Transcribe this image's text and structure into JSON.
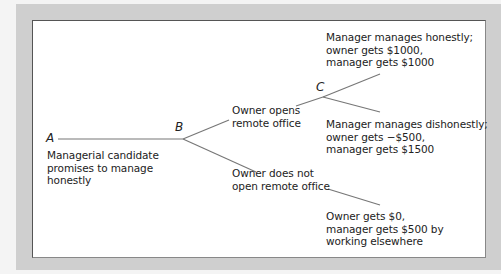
{
  "diagram": {
    "type": "game-tree",
    "nodes": {
      "A": {
        "label": "A"
      },
      "B": {
        "label": "B"
      },
      "C": {
        "label": "C"
      }
    },
    "labels": {
      "a_action": [
        "Managerial candidate",
        "promises to manage",
        "honestly"
      ],
      "b_open": [
        "Owner opens",
        "remote office"
      ],
      "b_not_open": [
        "Owner does not",
        "open remote office"
      ],
      "c_honest": [
        "Manager manages honestly;",
        "owner gets $1000,",
        "manager gets $1000"
      ],
      "c_dishonest": [
        "Manager manages dishonestly;",
        "owner gets −$500,",
        "manager gets $1500"
      ],
      "not_open_payoff": [
        "Owner gets $0,",
        "manager gets $500 by",
        "working elsewhere"
      ]
    },
    "colors": {
      "frame": "#cfcfcf",
      "panel": "#ffffff",
      "line": "#777777",
      "text": "#222222"
    }
  }
}
